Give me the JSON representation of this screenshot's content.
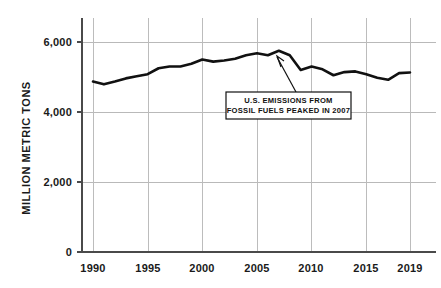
{
  "chart_data": {
    "type": "line",
    "title": "",
    "subtitle": "",
    "xlabel": "",
    "ylabel": "MILLION METRIC TONS",
    "xlim": [
      1990,
      2019
    ],
    "ylim": [
      0,
      6400
    ],
    "grid": true,
    "legend_position": "none",
    "y_ticks": [
      "0",
      "2,000",
      "4,000",
      "6,000"
    ],
    "y_tick_values": [
      0,
      2000,
      4000,
      6000
    ],
    "x_ticks": [
      "1990",
      "1995",
      "2000",
      "2005",
      "2010",
      "2015",
      "2019"
    ],
    "x_tick_values": [
      1990,
      1995,
      2000,
      2005,
      2010,
      2015,
      2019
    ],
    "x": [
      1990,
      1991,
      1992,
      1993,
      1994,
      1995,
      1996,
      1997,
      1998,
      1999,
      2000,
      2001,
      2002,
      2003,
      2004,
      2005,
      2006,
      2007,
      2008,
      2009,
      2010,
      2011,
      2012,
      2013,
      2014,
      2015,
      2016,
      2017,
      2018,
      2019
    ],
    "values": [
      4870,
      4790,
      4870,
      4960,
      5020,
      5080,
      5250,
      5300,
      5300,
      5380,
      5500,
      5440,
      5470,
      5520,
      5620,
      5680,
      5620,
      5750,
      5620,
      5200,
      5300,
      5220,
      5050,
      5140,
      5160,
      5080,
      4980,
      4920,
      5110,
      5130
    ],
    "series": [
      {
        "name": "U.S. CO2 emissions from fossil fuels",
        "color": "#111111",
        "values": [
          4870,
          4790,
          4870,
          4960,
          5020,
          5080,
          5250,
          5300,
          5300,
          5380,
          5500,
          5440,
          5470,
          5520,
          5620,
          5680,
          5620,
          5750,
          5620,
          5200,
          5300,
          5220,
          5050,
          5140,
          5160,
          5080,
          4980,
          4920,
          5110,
          5130
        ]
      }
    ],
    "annotations": [
      {
        "id": "peak-2007",
        "line1": "U.S. EMISSIONS FROM",
        "line2": "FOSSIL FUELS PEAKED IN 2007",
        "points_to_year": 2007,
        "points_to_value": 5750
      }
    ],
    "colors": {
      "line": "#111111",
      "grid": "#bcbcbc",
      "axis": "#4a4a4a",
      "text": "#1a1a1a",
      "background": "#ffffff"
    }
  }
}
